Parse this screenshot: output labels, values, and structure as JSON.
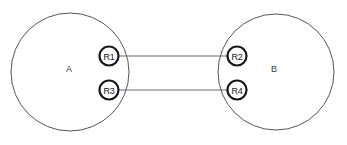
{
  "diagram": {
    "background_color": "#ffffff",
    "domain_stroke_color": "#55555a",
    "node_stroke_color": "#17171a",
    "link_color": "#6b6b70",
    "domains": [
      {
        "id": "domain-a",
        "label": "A",
        "cx": 70,
        "cy": 72,
        "r": 59,
        "label_x": 69,
        "label_y": 69
      },
      {
        "id": "domain-b",
        "label": "B",
        "cx": 276,
        "cy": 72,
        "r": 58,
        "label_x": 274,
        "label_y": 69
      }
    ],
    "nodes": [
      {
        "id": "node-r1",
        "label": "R1",
        "cx": 109,
        "cy": 56,
        "r": 9.5,
        "domain": "A"
      },
      {
        "id": "node-r3",
        "label": "R3",
        "cx": 109,
        "cy": 90,
        "r": 9.5,
        "domain": "A"
      },
      {
        "id": "node-r2",
        "label": "R2",
        "cx": 237,
        "cy": 56,
        "r": 9.5,
        "domain": "B"
      },
      {
        "id": "node-r4",
        "label": "R4",
        "cx": 237,
        "cy": 90,
        "r": 9.5,
        "domain": "B"
      }
    ],
    "links": [
      {
        "id": "link-r1-r2",
        "from": "R1",
        "to": "R2",
        "x1": 119,
        "y1": 56,
        "x2": 227,
        "y2": 56
      },
      {
        "id": "link-r3-r4",
        "from": "R3",
        "to": "R4",
        "x1": 119,
        "y1": 90,
        "x2": 227,
        "y2": 90
      }
    ]
  }
}
